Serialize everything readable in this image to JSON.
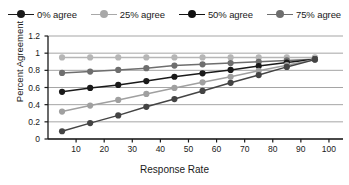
{
  "chart_data": {
    "type": "line",
    "title": "",
    "xlabel": "Response Rate",
    "ylabel": "Percent Agreement",
    "xlim": [
      0,
      105
    ],
    "ylim": [
      0,
      1.2
    ],
    "grid": true,
    "legend_position": "top",
    "xticks": [
      10,
      20,
      30,
      40,
      50,
      60,
      70,
      80,
      90,
      100
    ],
    "yticks": [
      "0",
      "0.2",
      "0.4",
      "0.6",
      "0.8",
      "1",
      "1.2"
    ],
    "ytick_values": [
      0,
      0.2,
      0.4,
      0.6,
      0.8,
      1,
      1.2
    ],
    "x": [
      5,
      15,
      25,
      35,
      45,
      55,
      65,
      75,
      85,
      95
    ],
    "series": [
      {
        "name": "100% agree",
        "color": "#b6b6b6",
        "in_legend": false,
        "values": [
          0.95,
          0.95,
          0.95,
          0.95,
          0.95,
          0.95,
          0.95,
          0.95,
          0.95,
          0.95
        ]
      },
      {
        "name": "75% agree",
        "color": "#6e6e6e",
        "in_legend": true,
        "values": [
          0.77,
          0.785,
          0.805,
          0.825,
          0.855,
          0.87,
          0.885,
          0.9,
          0.915,
          0.93
        ]
      },
      {
        "name": "50% agree",
        "color": "#1a1a1a",
        "in_legend": true,
        "values": [
          0.55,
          0.595,
          0.63,
          0.675,
          0.725,
          0.765,
          0.805,
          0.85,
          0.89,
          0.93
        ]
      },
      {
        "name": "25% agree",
        "color": "#a0a0a0",
        "in_legend": true,
        "values": [
          0.32,
          0.39,
          0.455,
          0.525,
          0.595,
          0.66,
          0.725,
          0.795,
          0.86,
          0.925
        ]
      },
      {
        "name": "0% agree",
        "color": "#444444",
        "in_legend": true,
        "values": [
          0.09,
          0.185,
          0.275,
          0.375,
          0.465,
          0.56,
          0.655,
          0.745,
          0.84,
          0.925
        ]
      }
    ]
  },
  "legend": {
    "items": [
      {
        "label": "0% agree",
        "color": "#1a1a1a"
      },
      {
        "label": "25% agree",
        "color": "#a8a8a8"
      },
      {
        "label": "50% agree",
        "color": "#111111"
      },
      {
        "label": "75% agree",
        "color": "#6e6e6e"
      }
    ]
  },
  "axes": {
    "x_title": "Response Rate",
    "y_title": "Percent Agreement"
  }
}
